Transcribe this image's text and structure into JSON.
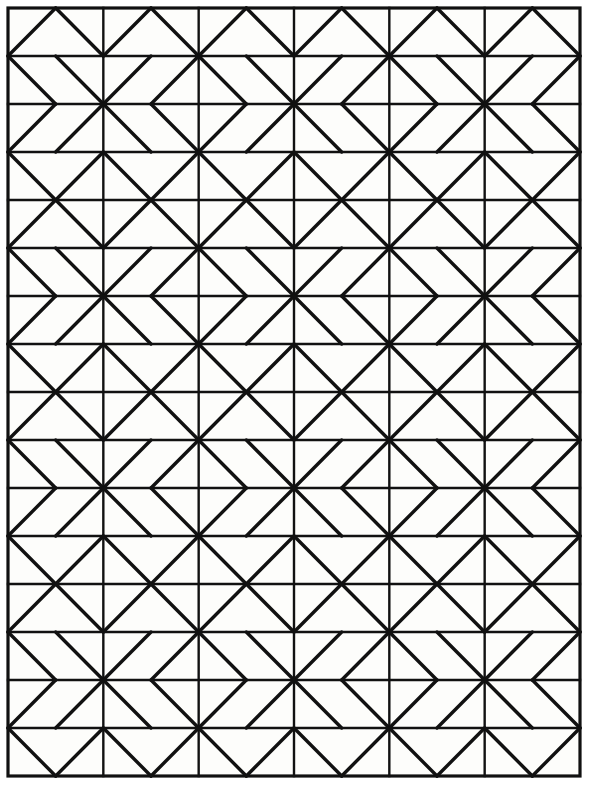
{
  "artwork": {
    "title": "Geometric Quilt Block Line Pattern",
    "description": "Black line drawing of a repeating quilt block pattern composed of squares with diagonals forming chevrons, triangles and pinwheel stars",
    "style": "coloring-page line art"
  },
  "canvas": {
    "width": 596,
    "height": 787,
    "background_color": "#fdfdfb",
    "line_color": "#111111"
  },
  "frame": {
    "x": 8,
    "y": 8,
    "width": 572,
    "height": 768,
    "stroke_width": 3.2
  },
  "grid": {
    "columns": 6,
    "rows": 16,
    "cell_width": 95.333,
    "cell_height": 48,
    "origin_x": 8,
    "origin_y": 8,
    "grid_stroke_width": 2.4,
    "diagonal_stroke_width": 3.4,
    "column_period": 2,
    "row_period": 4
  },
  "motif": {
    "name": "chevron-pinwheel-block",
    "cell_types": [
      "peak",
      "double-backslash",
      "double-slash",
      "valley"
    ],
    "row_pattern_even_column": [
      "peak",
      "double-backslash",
      "double-slash",
      "valley"
    ],
    "row_pattern_odd_column": [
      "peak",
      "double-slash",
      "double-backslash",
      "valley"
    ]
  },
  "chart_data": {
    "type": "table",
    "xlabel": "column index",
    "ylabel": "row index",
    "grid": true,
    "legend": "none",
    "columns": 6,
    "rows": 16,
    "cell_width": 95.333,
    "cell_height": 48,
    "categories": [
      "c0",
      "c1",
      "c2",
      "c3",
      "c4",
      "c5"
    ],
    "cells": [
      [
        "peak",
        "peak",
        "peak",
        "peak",
        "peak",
        "peak"
      ],
      [
        "dbs",
        "dsl",
        "dbs",
        "dsl",
        "dbs",
        "dsl"
      ],
      [
        "dsl",
        "dbs",
        "dsl",
        "dbs",
        "dsl",
        "dbs"
      ],
      [
        "valley",
        "valley",
        "valley",
        "valley",
        "valley",
        "valley"
      ],
      [
        "peak",
        "peak",
        "peak",
        "peak",
        "peak",
        "peak"
      ],
      [
        "dbs",
        "dsl",
        "dbs",
        "dsl",
        "dbs",
        "dsl"
      ],
      [
        "dsl",
        "dbs",
        "dsl",
        "dbs",
        "dsl",
        "dbs"
      ],
      [
        "valley",
        "valley",
        "valley",
        "valley",
        "valley",
        "valley"
      ],
      [
        "peak",
        "peak",
        "peak",
        "peak",
        "peak",
        "peak"
      ],
      [
        "dbs",
        "dsl",
        "dbs",
        "dsl",
        "dbs",
        "dsl"
      ],
      [
        "dsl",
        "dbs",
        "dsl",
        "dbs",
        "dsl",
        "dbs"
      ],
      [
        "valley",
        "valley",
        "valley",
        "valley",
        "valley",
        "valley"
      ],
      [
        "peak",
        "peak",
        "peak",
        "peak",
        "peak",
        "peak"
      ],
      [
        "dbs",
        "dsl",
        "dbs",
        "dsl",
        "dbs",
        "dsl"
      ],
      [
        "dsl",
        "dbs",
        "dsl",
        "dbs",
        "dsl",
        "dbs"
      ],
      [
        "valley",
        "valley",
        "valley",
        "valley",
        "valley",
        "valley"
      ]
    ],
    "legend_keys": {
      "peak": "two diagonals meeting at top-center forming an upward chevron",
      "valley": "two diagonals meeting at bottom-center forming a downward chevron",
      "dbs": "two parallel backslash diagonals",
      "dsl": "two parallel slash diagonals"
    }
  }
}
